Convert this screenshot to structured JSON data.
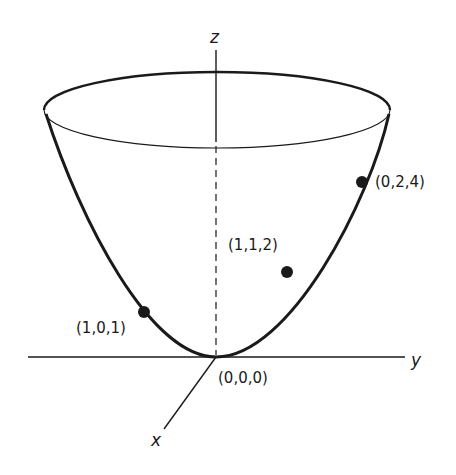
{
  "figure": {
    "colors": {
      "ink": "#1a1a1a",
      "background": "#ffffff"
    },
    "axes": {
      "z": {
        "label": "z"
      },
      "y": {
        "label": "y"
      },
      "x": {
        "label": "x"
      }
    },
    "points": [
      {
        "label": "(0,0,0)",
        "name": "origin"
      },
      {
        "label": "(1,0,1)",
        "name": "point-1-0-1"
      },
      {
        "label": "(1,1,2)",
        "name": "point-1-1-2"
      },
      {
        "label": "(0,2,4)",
        "name": "point-0-2-4"
      }
    ]
  }
}
